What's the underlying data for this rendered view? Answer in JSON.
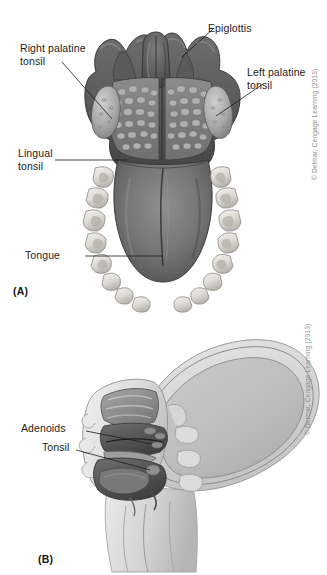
{
  "figure": {
    "background_color": "#ffffff",
    "ink_color": "#1c1c1c",
    "credit_color": "#8e8e8e"
  },
  "panel_a": {
    "letter": "(A)",
    "credit": "© Delmar, Cengage Learning (2013)",
    "labels": [
      {
        "id": "epiglottis",
        "text": "Epiglottis"
      },
      {
        "id": "right-palatine-tonsil",
        "text": "Right palatine\ntonsil"
      },
      {
        "id": "left-palatine-tonsil",
        "text": "Left palatine\ntonsil"
      },
      {
        "id": "lingual-tonsil",
        "text": "Lingual\ntonsil"
      },
      {
        "id": "tongue",
        "text": "Tongue"
      }
    ]
  },
  "panel_b": {
    "letter": "(B)",
    "credit": "© Delmar, Cengage Learning (2013)",
    "labels": [
      {
        "id": "adenoids",
        "text": "Adenoids"
      },
      {
        "id": "tonsil",
        "text": "Tonsil"
      }
    ]
  }
}
